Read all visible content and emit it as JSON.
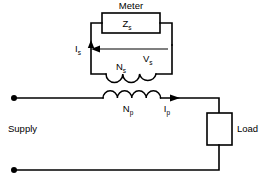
{
  "diagram": {
    "labels": {
      "meter": "Meter",
      "zs_main": "Z",
      "zs_sub": "s",
      "is_main": "I",
      "is_sub": "s",
      "vs_main": "V",
      "vs_sub": "s",
      "ns_main": "N",
      "ns_sub": "s",
      "np_main": "N",
      "np_sub": "p",
      "ip_main": "I",
      "ip_sub": "p",
      "supply": "Supply",
      "load": "Load"
    },
    "components": {
      "meter_box": "burden-impedance-box",
      "secondary_coil": "secondary-winding",
      "primary_coil": "primary-winding",
      "load_box": "load-box",
      "supply_terminal_top": "supply-terminal-top",
      "supply_terminal_bottom": "supply-terminal-bottom"
    },
    "colors": {
      "line": "#000000",
      "background": "#ffffff",
      "text": "#000000"
    }
  }
}
